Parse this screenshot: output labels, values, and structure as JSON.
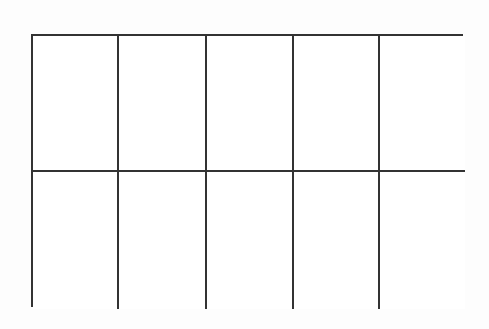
{
  "diagram": {
    "type": "empty-grid",
    "rows": 2,
    "columns": 5,
    "line_color": "#333333",
    "cells": [
      [
        "",
        "",
        "",
        "",
        ""
      ],
      [
        "",
        "",
        "",
        "",
        ""
      ]
    ]
  }
}
